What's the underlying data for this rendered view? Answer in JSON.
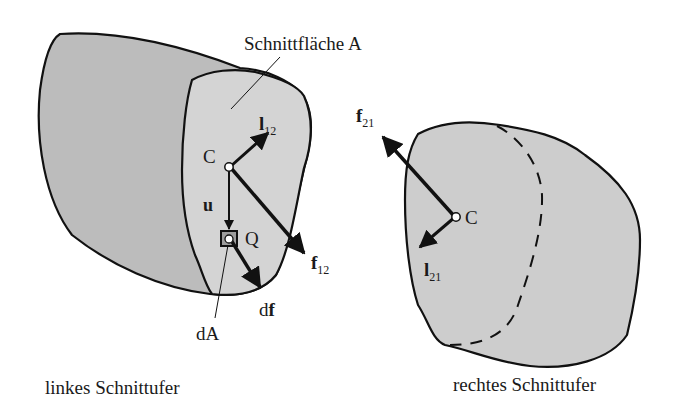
{
  "diagram": {
    "left_body": {
      "caption": "linkes Schnittufer",
      "cut_surface_label": "Schnittfläche A",
      "centroid_label": "C",
      "point_label": "Q",
      "area_element_label": "dA",
      "position_vector_label": "u",
      "moment_vector": {
        "base": "l",
        "sub": "12"
      },
      "force_vector": {
        "base": "f",
        "sub": "12"
      },
      "force_element": {
        "prefix": "d",
        "base": "f"
      }
    },
    "right_body": {
      "caption": "rechtes Schnittufer",
      "centroid_label": "C",
      "moment_vector": {
        "base": "l",
        "sub": "21"
      },
      "force_vector": {
        "base": "f",
        "sub": "21"
      }
    },
    "colors": {
      "body_dark": "#b9b9b9",
      "body_light": "#d2d2d2",
      "stroke": "#111111",
      "background": "#ffffff"
    }
  }
}
